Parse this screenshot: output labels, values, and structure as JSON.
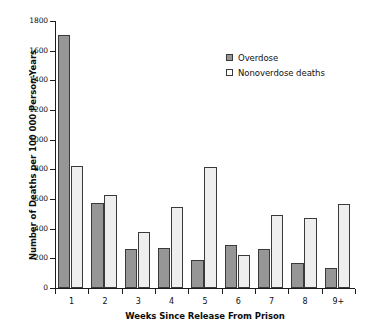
{
  "chart_data": {
    "type": "bar",
    "title": "",
    "xlabel": "Weeks Since Release From Prison",
    "ylabel": "Number of Deaths per 100 000 Person-Years",
    "categories": [
      "1",
      "2",
      "3",
      "4",
      "5",
      "6",
      "7",
      "8",
      "9+"
    ],
    "series": [
      {
        "name": "Overdose",
        "color": "#969696",
        "values": [
          1705,
          570,
          260,
          272,
          188,
          290,
          262,
          170,
          138
        ]
      },
      {
        "name": "Nonoverdose deaths",
        "color": "#eeeeee",
        "values": [
          825,
          625,
          380,
          545,
          815,
          225,
          492,
          475,
          565
        ]
      }
    ],
    "ylim": [
      0,
      1800
    ],
    "yticks": [
      0,
      200,
      400,
      600,
      800,
      1000,
      1200,
      1400,
      1600,
      1800
    ],
    "ytick_labels": [
      "0",
      "200",
      "400",
      "600",
      "800",
      "1000",
      "1200",
      "1400",
      "1600",
      "1800"
    ],
    "grid": false,
    "legend_position": "top-right"
  },
  "legend": {
    "items": [
      {
        "label": "Overdose",
        "swatch": "filled-gray-square"
      },
      {
        "label": "Nonoverdose deaths",
        "swatch": "open-white-square"
      }
    ]
  }
}
